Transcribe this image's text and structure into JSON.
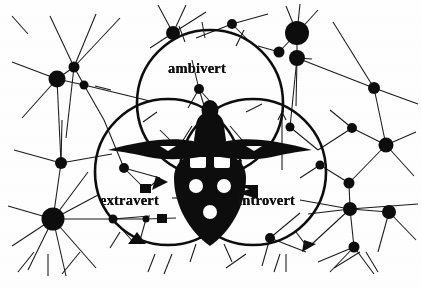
{
  "image": {
    "title": "Extravert Ambivert Introvert Venn Diagram",
    "background_color": "#ffffff",
    "ink_color": "#111111",
    "width": 421,
    "height": 287,
    "style": "black-and-white scanned line drawing"
  },
  "venn": {
    "labels": {
      "top": "ambivert",
      "bottom_left": "extravert",
      "bottom_right": "introvert"
    },
    "circles": [
      {
        "name": "ambivert-circle",
        "cx": 210,
        "cy": 103,
        "r": 73
      },
      {
        "name": "extravert-circle",
        "cx": 168,
        "cy": 172,
        "r": 73
      },
      {
        "name": "introvert-circle",
        "cx": 253,
        "cy": 172,
        "r": 73
      }
    ],
    "stroke_width": 2.6
  },
  "center_figure": {
    "name": "winged-meditating-figure",
    "description": "dark silhouette of a seated figure with outstretched wing-like arms above a shield shape bearing white dots",
    "dot_count": 5,
    "panel_count": 2
  },
  "network": {
    "description": "background constellation of filled nodes connected by thin straight lines",
    "nodes": [
      {
        "cx": 57,
        "cy": 79,
        "r": 8.5
      },
      {
        "cx": 74,
        "cy": 67,
        "r": 5.5
      },
      {
        "cx": 84,
        "cy": 85,
        "r": 4.5
      },
      {
        "cx": 61,
        "cy": 163,
        "r": 6.0
      },
      {
        "cx": 53,
        "cy": 219,
        "r": 11.5
      },
      {
        "cx": 173,
        "cy": 33,
        "r": 7.0
      },
      {
        "cx": 232,
        "cy": 24,
        "r": 5.0
      },
      {
        "cx": 199,
        "cy": 89,
        "r": 5.0
      },
      {
        "cx": 297,
        "cy": 33,
        "r": 12.0
      },
      {
        "cx": 279,
        "cy": 52,
        "r": 5.5
      },
      {
        "cx": 297,
        "cy": 58,
        "r": 8.0
      },
      {
        "cx": 374,
        "cy": 88,
        "r": 6.0
      },
      {
        "cx": 386,
        "cy": 145,
        "r": 7.5
      },
      {
        "cx": 352,
        "cy": 128,
        "r": 5.0
      },
      {
        "cx": 349,
        "cy": 183,
        "r": 5.5
      },
      {
        "cx": 350,
        "cy": 209,
        "r": 7.0
      },
      {
        "cx": 389,
        "cy": 212,
        "r": 7.0
      },
      {
        "cx": 354,
        "cy": 247,
        "r": 5.5
      },
      {
        "cx": 124,
        "cy": 168,
        "r": 5.0
      },
      {
        "cx": 113,
        "cy": 219,
        "r": 4.5
      },
      {
        "cx": 146,
        "cy": 219,
        "r": 3.5
      },
      {
        "cx": 270,
        "cy": 238,
        "r": 5.0
      },
      {
        "cx": 320,
        "cy": 165,
        "r": 4.5
      },
      {
        "cx": 290,
        "cy": 127,
        "r": 4.5
      }
    ]
  },
  "annotations": {
    "arrow_near_introvert": "left-pointing arrowhead",
    "arrow_near_extravert": "right-pointing arrowhead",
    "tick_marks": "short radial tick strokes around the circle rim"
  }
}
